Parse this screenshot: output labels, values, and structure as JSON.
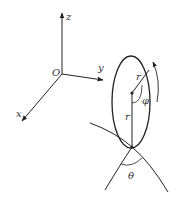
{
  "diagram": {
    "type": "3d-coordinate-system-with-rolling-disc",
    "axes": {
      "origin_label": "O",
      "x_label": "x",
      "y_label": "y",
      "z_label": "z"
    },
    "disc": {
      "radius_label_upper": "r",
      "radius_label_lower": "r",
      "angle_label_phi": "φ",
      "rotation_arrow": "clockwise-arc-arrow"
    },
    "surface": {
      "angle_label_theta": "θ"
    },
    "colors": {
      "stroke": "#222222",
      "background": "#ffffff"
    }
  }
}
